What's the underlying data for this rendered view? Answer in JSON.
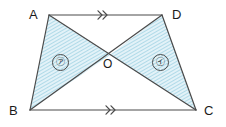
{
  "figure": {
    "type": "geometry-diagram",
    "shape_name": "trapezoid",
    "width": 226,
    "height": 127,
    "background_color": "#ffffff",
    "stroke_color": "#4a4a4a",
    "shade_fill_color": "#d9eef5",
    "hatch_line_color": "#7fc4da"
  },
  "vertices": {
    "a": {
      "label": "A",
      "x": 49,
      "y": 15,
      "label_x": 29,
      "label_y": 8
    },
    "b": {
      "label": "B",
      "x": 30,
      "y": 110,
      "label_x": 9,
      "label_y": 104
    },
    "c": {
      "label": "C",
      "x": 196,
      "y": 110,
      "label_x": 204,
      "label_y": 104
    },
    "d": {
      "label": "D",
      "x": 162,
      "y": 15,
      "label_x": 172,
      "label_y": 8
    }
  },
  "intersection": {
    "label": "O",
    "x": 110,
    "y": 55,
    "label_x": 103,
    "label_y": 58
  },
  "regions": [
    {
      "label": "㋐",
      "name": "region-a",
      "description": "triangle-ABO",
      "label_x": 52,
      "label_y": 54
    },
    {
      "label": "㋑",
      "name": "region-i",
      "description": "triangle-OCD",
      "label_x": 152,
      "label_y": 54
    }
  ],
  "parallel_marks": [
    {
      "name": "parallel-mark-ad",
      "side": "AD",
      "glyph": "double-chevron",
      "x": 105,
      "y": 15
    },
    {
      "name": "parallel-mark-bc",
      "side": "BC",
      "glyph": "double-chevron",
      "x": 113,
      "y": 110
    }
  ]
}
